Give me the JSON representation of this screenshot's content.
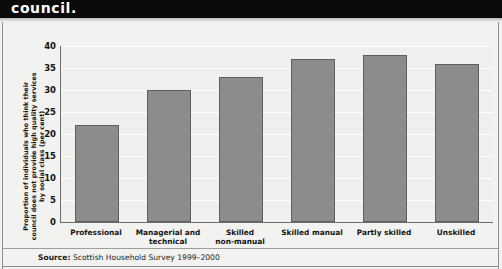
{
  "banner": {
    "text": "council."
  },
  "chart_data": {
    "type": "bar",
    "title": "",
    "xlabel": "",
    "ylabel": "Proportion of individuals who think their council does not provide high quality services by social class (per cent)",
    "ylabel_line1": "Proportion of individuals who think their",
    "ylabel_line2": "council does not provide high quality services",
    "ylabel_line3": "by social class (per cent)",
    "categories": [
      "Professional",
      "Managerial and technical",
      "Skilled non-manual",
      "Skilled manual",
      "Partly skilled",
      "Unskilled"
    ],
    "category_lines": [
      [
        "Professional"
      ],
      [
        "Managerial and",
        "technical"
      ],
      [
        "Skilled",
        "non-manual"
      ],
      [
        "Skilled manual"
      ],
      [
        "Partly skilled"
      ],
      [
        "Unskilled"
      ]
    ],
    "values": [
      22,
      30,
      33,
      37,
      38,
      36
    ],
    "ylim": [
      0,
      40
    ],
    "ytick_values": [
      0,
      5,
      10,
      15,
      20,
      25,
      30,
      35,
      40
    ],
    "ytick_labels": [
      "0",
      "5",
      "10",
      "15",
      "20",
      "25",
      "30",
      "35",
      "40"
    ],
    "grid": true,
    "legend": false,
    "bar_color": "#8c8c8a",
    "bar_border_color": "#5e5e5c",
    "plot_background": "#efefed",
    "gridline_color": "#ffffff"
  },
  "source": {
    "label": "Source:",
    "text": " Scottish Household Survey 1999–2000"
  }
}
